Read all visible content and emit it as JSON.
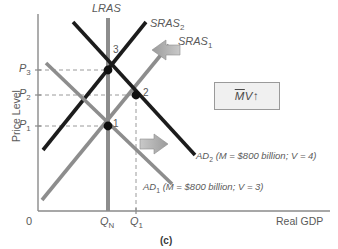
{
  "figure": {
    "caption": "(c)",
    "axes": {
      "y_label": "Price Level",
      "x_label": "Real GDP",
      "origin_label": "0",
      "y_ticks": [
        {
          "name": "P3",
          "text": "P",
          "sub": "3",
          "y": 70
        },
        {
          "name": "P2",
          "text": "P",
          "sub": "2",
          "y": 95
        },
        {
          "name": "P1",
          "text": "P",
          "sub": "1",
          "y": 126
        }
      ],
      "x_ticks": [
        {
          "name": "QN",
          "text": "Q",
          "sub": "N",
          "x": 108
        },
        {
          "name": "Q1",
          "text": "Q",
          "sub": "1",
          "x": 136
        }
      ]
    },
    "curves": [
      {
        "name": "LRAS",
        "label": "LRAS",
        "sub": "",
        "color": "#8d8d8d"
      },
      {
        "name": "SRAS2",
        "label": "SRAS",
        "sub": "2",
        "color": "#1c1c1c"
      },
      {
        "name": "SRAS1",
        "label": "SRAS",
        "sub": "1",
        "color": "#8d8d8d"
      },
      {
        "name": "AD2",
        "label": "AD",
        "sub": "2",
        "color": "#1c1c1c",
        "annotation": "(M = $800 billion; V = 4)"
      },
      {
        "name": "AD1",
        "label": "AD",
        "sub": "1",
        "color": "#8d8d8d",
        "annotation": "(M = $800 billion; V = 3)"
      }
    ],
    "equilibria": [
      {
        "name": "point-1",
        "label": "1",
        "x": 108,
        "y": 126
      },
      {
        "name": "point-2",
        "label": "2",
        "x": 136,
        "y": 95
      },
      {
        "name": "point-3",
        "label": "3",
        "x": 108,
        "y": 70
      }
    ],
    "callout": {
      "money_symbol": "M",
      "velocity_symbol": "V",
      "direction_arrow": "↑"
    },
    "shift_arrows": [
      {
        "name": "sras-shift-arrow",
        "direction": "left"
      },
      {
        "name": "ad-shift-arrow",
        "direction": "right"
      }
    ],
    "colors": {
      "dark_curve": "#1c1c1c",
      "gray_curve": "#8d8d8d",
      "axis": "#8a8a8a",
      "dashed": "#9a9a9a",
      "arrow_fill": "#a8a8a8",
      "box_bg": "#f0f0f0",
      "text": "#5a5a5a"
    }
  }
}
